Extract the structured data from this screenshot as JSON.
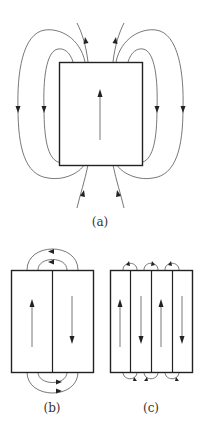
{
  "figure": {
    "panels": [
      {
        "id": "a",
        "label": "(a)",
        "description": "Single magnetic domain with external stray field lines",
        "magnetization": [
          "up"
        ]
      },
      {
        "id": "b",
        "label": "(b)",
        "description": "Two antiparallel domains with closing field loops",
        "magnetization": [
          "up",
          "down"
        ]
      },
      {
        "id": "c",
        "label": "(c)",
        "description": "Four alternating domains with small closure loops",
        "magnetization": [
          "up",
          "down",
          "up",
          "down"
        ]
      }
    ],
    "colors": {
      "line": "#333333",
      "background": "#ffffff"
    }
  }
}
